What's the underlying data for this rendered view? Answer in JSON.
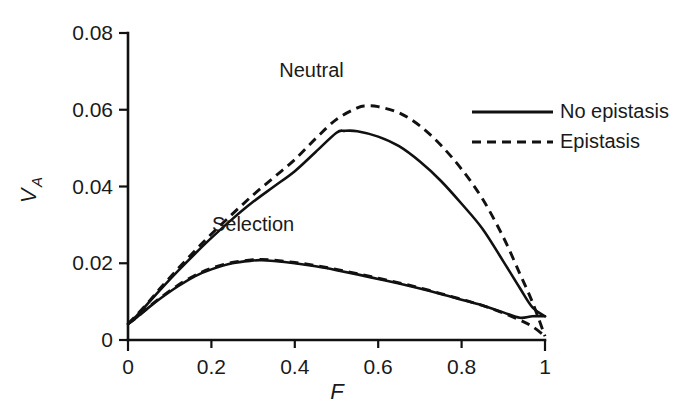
{
  "chart_data": {
    "type": "line",
    "title": "",
    "xlabel": "F",
    "ylabel": "V",
    "ylabel_sub": "A",
    "xlim": [
      0,
      1
    ],
    "ylim": [
      0,
      0.08
    ],
    "grid": false,
    "x_ticks": [
      "0",
      "0.2",
      "0.4",
      "0.6",
      "0.8",
      "1"
    ],
    "x_tick_values": [
      0,
      0.2,
      0.4,
      0.6,
      0.8,
      1
    ],
    "y_ticks": [
      "0",
      "0.02",
      "0.04",
      "0.06",
      "0.08"
    ],
    "y_tick_values": [
      0,
      0.02,
      0.04,
      0.06,
      0.08
    ],
    "legend_position": "right-top",
    "annotations": [
      {
        "text": "Neutral",
        "x": 0.44,
        "y": 0.0685
      },
      {
        "text": "Selection",
        "x": 0.3,
        "y": 0.0285
      }
    ],
    "series": [
      {
        "name": "Neutral, No epistasis",
        "group": "Neutral",
        "style": "solid",
        "x": [
          0.0,
          0.02,
          0.05,
          0.08,
          0.12,
          0.16,
          0.2,
          0.25,
          0.3,
          0.35,
          0.4,
          0.45,
          0.5,
          0.52,
          0.55,
          0.6,
          0.65,
          0.7,
          0.75,
          0.8,
          0.85,
          0.9,
          0.94,
          0.97,
          1.0
        ],
        "y": [
          0.0042,
          0.0062,
          0.0098,
          0.0134,
          0.018,
          0.0224,
          0.0266,
          0.0315,
          0.036,
          0.04,
          0.044,
          0.049,
          0.054,
          0.0545,
          0.0544,
          0.053,
          0.0505,
          0.0465,
          0.0415,
          0.0355,
          0.029,
          0.0205,
          0.0135,
          0.0085,
          0.0062
        ]
      },
      {
        "name": "Neutral, Epistasis",
        "group": "Neutral",
        "style": "dashed",
        "x": [
          0.0,
          0.02,
          0.05,
          0.08,
          0.12,
          0.16,
          0.2,
          0.25,
          0.3,
          0.35,
          0.4,
          0.45,
          0.5,
          0.55,
          0.57,
          0.6,
          0.65,
          0.7,
          0.75,
          0.8,
          0.85,
          0.9,
          0.94,
          0.97,
          1.0
        ],
        "y": [
          0.0042,
          0.0064,
          0.01,
          0.0138,
          0.0186,
          0.0232,
          0.0276,
          0.0328,
          0.0378,
          0.0424,
          0.047,
          0.0525,
          0.0575,
          0.0605,
          0.061,
          0.0608,
          0.0592,
          0.0558,
          0.0508,
          0.0445,
          0.0368,
          0.0268,
          0.0172,
          0.0098,
          0.001
        ]
      },
      {
        "name": "Selection, No epistasis",
        "group": "Selection",
        "style": "solid",
        "x": [
          0.0,
          0.02,
          0.05,
          0.08,
          0.12,
          0.16,
          0.2,
          0.25,
          0.3,
          0.32,
          0.35,
          0.4,
          0.45,
          0.5,
          0.55,
          0.6,
          0.65,
          0.7,
          0.75,
          0.8,
          0.85,
          0.9,
          0.94,
          0.97,
          1.0
        ],
        "y": [
          0.0042,
          0.0058,
          0.0085,
          0.011,
          0.014,
          0.0166,
          0.0184,
          0.02,
          0.0207,
          0.0208,
          0.0206,
          0.02,
          0.0192,
          0.0182,
          0.0171,
          0.0159,
          0.0147,
          0.0134,
          0.012,
          0.0105,
          0.009,
          0.0072,
          0.0058,
          0.0062,
          0.0062
        ]
      },
      {
        "name": "Selection, Epistasis",
        "group": "Selection",
        "style": "dashed",
        "x": [
          0.0,
          0.02,
          0.05,
          0.08,
          0.12,
          0.16,
          0.2,
          0.25,
          0.3,
          0.32,
          0.35,
          0.4,
          0.45,
          0.5,
          0.55,
          0.6,
          0.65,
          0.7,
          0.75,
          0.8,
          0.85,
          0.9,
          0.94,
          0.97,
          1.0
        ],
        "y": [
          0.0042,
          0.0058,
          0.0086,
          0.0112,
          0.0143,
          0.0168,
          0.0187,
          0.0202,
          0.0209,
          0.021,
          0.0208,
          0.0202,
          0.0194,
          0.0184,
          0.0173,
          0.0161,
          0.0149,
          0.0136,
          0.0121,
          0.0106,
          0.009,
          0.007,
          0.0052,
          0.0035,
          0.001
        ]
      }
    ],
    "legend": [
      {
        "label": "No epistasis",
        "style": "solid"
      },
      {
        "label": "Epistasis",
        "style": "dashed"
      }
    ]
  }
}
